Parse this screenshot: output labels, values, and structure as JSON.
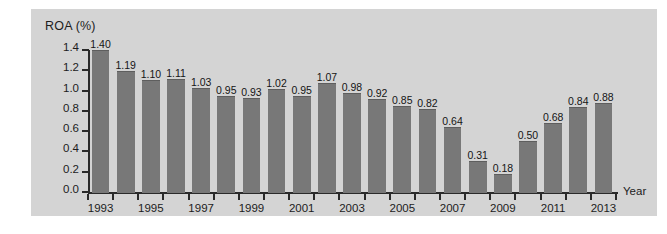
{
  "chart_data": {
    "type": "bar",
    "title": "ROA (%)",
    "xlabel": "Year",
    "ylabel": "ROA (%)",
    "ylim": [
      0.0,
      1.4
    ],
    "ytick_labels": [
      "0.0",
      "0.2",
      "0.4",
      "0.6",
      "0.8",
      "1.0",
      "1.2",
      "1.4"
    ],
    "ytick_values": [
      0.0,
      0.2,
      0.4,
      0.6,
      0.8,
      1.0,
      1.2,
      1.4
    ],
    "grid": false,
    "legend": null,
    "categories": [
      "1993",
      "1994",
      "1995",
      "1996",
      "1997",
      "1998",
      "1999",
      "2000",
      "2001",
      "2002",
      "2003",
      "2004",
      "2005",
      "2006",
      "2007",
      "2008",
      "2009",
      "2010",
      "2011",
      "2012",
      "2013"
    ],
    "xtick_labels_shown": [
      "1993",
      "1995",
      "1997",
      "1999",
      "2001",
      "2003",
      "2005",
      "2007",
      "2009",
      "2011",
      "2013"
    ],
    "values": [
      1.4,
      1.19,
      1.1,
      1.11,
      1.03,
      0.95,
      0.93,
      1.02,
      0.95,
      1.07,
      0.98,
      0.92,
      0.85,
      0.82,
      0.64,
      0.31,
      0.18,
      0.5,
      0.68,
      0.84,
      0.88
    ],
    "value_labels": [
      "1.40",
      "1.19",
      "1.10",
      "1.11",
      "1.03",
      "0.95",
      "0.93",
      "1.02",
      "0.95",
      "1.07",
      "0.98",
      "0.92",
      "0.85",
      "0.82",
      "0.64",
      "0.31",
      "0.18",
      "0.50",
      "0.68",
      "0.84",
      "0.88"
    ],
    "colors": {
      "bar": "#787878",
      "panel_background": "#d4d4d4",
      "page_background": "#ffffff",
      "axis": "#2a2a2a",
      "text": "#1c1c1c"
    }
  }
}
